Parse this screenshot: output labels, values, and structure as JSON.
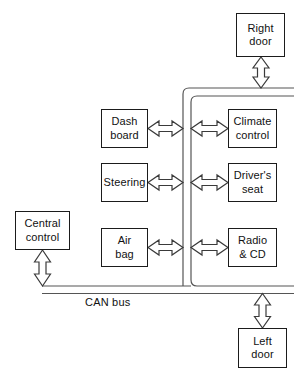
{
  "diagram": {
    "bus_label": "CAN bus",
    "colors": {
      "line": "#555555",
      "box_border": "#1b1b1b",
      "arrow_stroke": "#3a3a3a",
      "text": "#111111",
      "background": "#ffffff"
    },
    "nodes": [
      {
        "id": "right-door",
        "line1": "Right",
        "line2": "door"
      },
      {
        "id": "dash-board",
        "line1": "Dash",
        "line2": "board"
      },
      {
        "id": "climate-control",
        "line1": "Climate",
        "line2": "control"
      },
      {
        "id": "steering",
        "line1": "Steering",
        "line2": ""
      },
      {
        "id": "drivers-seat",
        "line1": "Driver's",
        "line2": "seat"
      },
      {
        "id": "central-control",
        "line1": "Central",
        "line2": "control"
      },
      {
        "id": "air-bag",
        "line1": "Air",
        "line2": "bag"
      },
      {
        "id": "radio-cd",
        "line1": "Radio",
        "line2": "& CD"
      },
      {
        "id": "left-door",
        "line1": "Left",
        "line2": "door"
      }
    ],
    "connections": [
      {
        "from": "right-door",
        "to": "bus",
        "kind": "double-arrow",
        "orientation": "vertical"
      },
      {
        "from": "dash-board",
        "to": "bus-branch-left",
        "kind": "double-arrow",
        "orientation": "horizontal"
      },
      {
        "from": "bus-branch-right",
        "to": "climate-control",
        "kind": "double-arrow",
        "orientation": "horizontal"
      },
      {
        "from": "steering",
        "to": "bus-branch-left",
        "kind": "double-arrow",
        "orientation": "horizontal"
      },
      {
        "from": "bus-branch-right",
        "to": "drivers-seat",
        "kind": "double-arrow",
        "orientation": "horizontal"
      },
      {
        "from": "air-bag",
        "to": "bus-branch-left",
        "kind": "double-arrow",
        "orientation": "horizontal"
      },
      {
        "from": "bus-branch-right",
        "to": "radio-cd",
        "kind": "double-arrow",
        "orientation": "horizontal"
      },
      {
        "from": "central-control",
        "to": "bus",
        "kind": "double-arrow",
        "orientation": "vertical"
      },
      {
        "from": "bus",
        "to": "left-door",
        "kind": "double-arrow",
        "orientation": "vertical"
      }
    ]
  }
}
